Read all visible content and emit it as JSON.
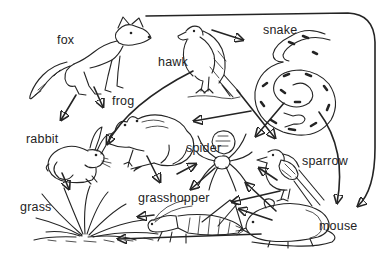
{
  "food_web": {
    "description": "hand-drawn food web diagram, arrows point from predator to prey",
    "organisms": [
      {
        "id": "fox",
        "label": "fox"
      },
      {
        "id": "hawk",
        "label": "hawk"
      },
      {
        "id": "snake",
        "label": "snake"
      },
      {
        "id": "frog",
        "label": "frog"
      },
      {
        "id": "rabbit",
        "label": "rabbit"
      },
      {
        "id": "grass",
        "label": "grass"
      },
      {
        "id": "grasshopper",
        "label": "grasshopper"
      },
      {
        "id": "spider",
        "label": "spider"
      },
      {
        "id": "sparrow",
        "label": "sparrow"
      },
      {
        "id": "mouse",
        "label": "mouse"
      }
    ],
    "relationships": [
      {
        "from": "fox",
        "to": "rabbit"
      },
      {
        "from": "fox",
        "to": "frog"
      },
      {
        "from": "fox",
        "to": "mouse"
      },
      {
        "from": "hawk",
        "to": "snake"
      },
      {
        "from": "hawk",
        "to": "rabbit"
      },
      {
        "from": "hawk",
        "to": "sparrow"
      },
      {
        "from": "snake",
        "to": "frog"
      },
      {
        "from": "snake",
        "to": "spider"
      },
      {
        "from": "snake",
        "to": "mouse"
      },
      {
        "from": "frog",
        "to": "grasshopper"
      },
      {
        "from": "frog",
        "to": "spider"
      },
      {
        "from": "spider",
        "to": "grasshopper"
      },
      {
        "from": "sparrow",
        "to": "spider"
      },
      {
        "from": "sparrow",
        "to": "grasshopper"
      },
      {
        "from": "mouse",
        "to": "spider"
      },
      {
        "from": "mouse",
        "to": "grasshopper"
      },
      {
        "from": "mouse",
        "to": "grass"
      },
      {
        "from": "rabbit",
        "to": "grass"
      },
      {
        "from": "grasshopper",
        "to": "grass"
      }
    ],
    "colors": {
      "ink": "#242424",
      "background": "#ffffff"
    }
  }
}
